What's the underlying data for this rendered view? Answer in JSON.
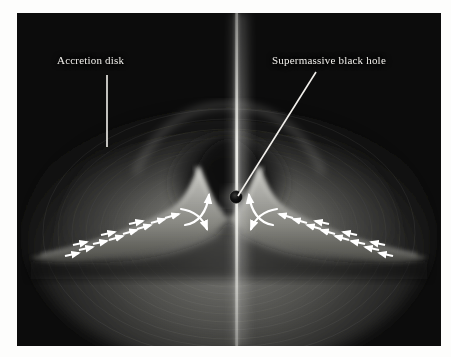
{
  "figure": {
    "medium": "grayscale astronomical illustration",
    "plate": {
      "left": 17,
      "top": 13,
      "width": 424,
      "height": 333,
      "background_color": "#0c0c0c"
    },
    "page_background": "#fdfdfc"
  },
  "annotations": [
    {
      "id": "accretion-disk",
      "label": "Accretion disk",
      "label_x": 57,
      "label_y": 54,
      "leader": {
        "type": "straight-vertical",
        "x1": 107,
        "y1": 75,
        "x2": 107,
        "y2": 147
      },
      "color": "#f2f0ec"
    },
    {
      "id": "supermassive-black-hole",
      "label": "Supermassive black hole",
      "label_x": 272,
      "label_y": 54,
      "leader": {
        "type": "straight-diagonal",
        "x1": 316,
        "y1": 72,
        "x2": 238,
        "y2": 196
      },
      "color": "#f2f0ec"
    }
  ],
  "scene": {
    "black_hole": {
      "cx": 235,
      "cy": 197,
      "r": 7,
      "color": "#0a0a0a"
    },
    "jet": {
      "axis_x": 235,
      "top_y": 13,
      "bottom_y": 346,
      "core_color": "#e8e8e4",
      "description": "bright vertical bipolar jet beam along the rotation axis"
    },
    "disk": {
      "description": "bright flared torus with twin inner peaks and outward-sweeping wings",
      "halo_description": "broad concentric-ringed glow dome arching above the torus",
      "peak_left_x": 196,
      "peak_right_x": 274,
      "peak_y": 165,
      "outer_left_x": 30,
      "outer_right_x": 412,
      "midplane_y": 243
    },
    "flow_arrows": {
      "left_side_direction": "inward (pointing right, toward black hole)",
      "right_side_direction": "inward (pointing left, toward black hole)",
      "curved_arrows": "vertical outflow curls adjacent to the black hole, turning up and down along the jet axis",
      "color": "#ffffff",
      "count_left_straight": 11,
      "count_right_straight": 11,
      "count_curved": 4
    }
  },
  "colors": {
    "plate_dark": "#0c0c0c",
    "disk_bright": "#b9b9b4",
    "disk_mid": "#6e6e6a",
    "halo_dim": "#3a3a38",
    "arrow_white": "#ffffff",
    "label_white": "#f2f0ec"
  }
}
